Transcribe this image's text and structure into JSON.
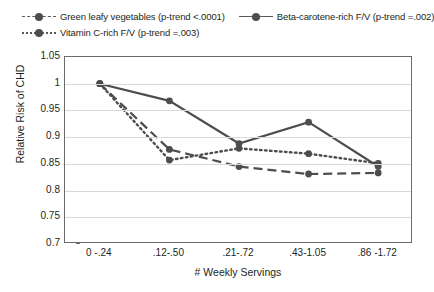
{
  "chart_data": {
    "type": "line",
    "title": "",
    "xlabel": "# Weekly Servings",
    "ylabel": "Relative Risk of CHD",
    "categories": [
      "0 -.24",
      ".12-.50",
      ".21-.72",
      ".43-1.05",
      ".86 -1.72"
    ],
    "ylim": [
      0.7,
      1.05
    ],
    "yticks": [
      "0.7",
      "0.75",
      "0.8",
      "0.85",
      "0.9",
      "0.95",
      "1",
      "1.05"
    ],
    "ytick_values": [
      0.7,
      0.75,
      0.8,
      0.85,
      0.9,
      0.95,
      1.0,
      1.05
    ],
    "grid": true,
    "legend_position": "top",
    "series": [
      {
        "name": "Green leafy vegetables (p-trend <.0001)",
        "style": "dashed",
        "color": "#4d4d4d",
        "values": [
          1.0,
          0.877,
          0.845,
          0.831,
          0.833
        ]
      },
      {
        "name": "Beta-carotene-rich F/V (p-trend =.002)",
        "style": "solid",
        "color": "#4d4d4d",
        "values": [
          1.0,
          0.968,
          0.888,
          0.928,
          0.845
        ]
      },
      {
        "name": "Vitamin C-rich F/V (p-trend =.003)",
        "style": "dotted",
        "color": "#4d4d4d",
        "values": [
          1.0,
          0.857,
          0.879,
          0.869,
          0.851
        ]
      }
    ]
  }
}
